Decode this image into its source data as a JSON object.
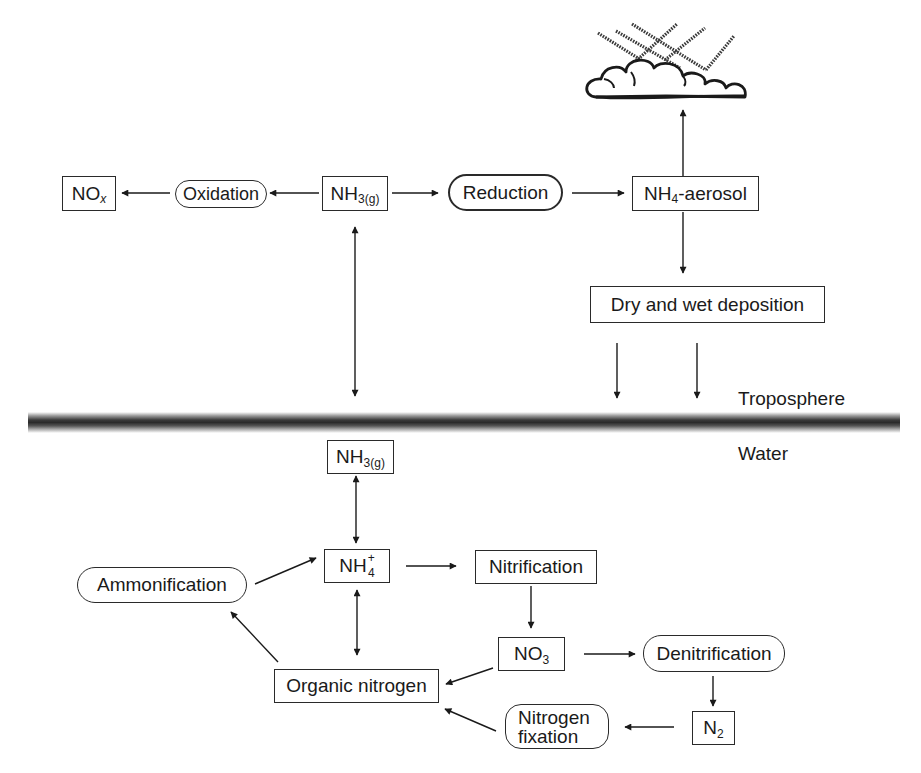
{
  "diagram": {
    "type": "flow",
    "title": "",
    "layers": {
      "upper_label": "Troposphere",
      "lower_label": "Water"
    },
    "nodes": {
      "nox": {
        "main": "NO",
        "sub": "x",
        "shape": "box"
      },
      "oxidation": {
        "label": "Oxidation",
        "shape": "pill"
      },
      "nh3_air": {
        "main": "NH",
        "sub": "3(g)",
        "shape": "box"
      },
      "reduction": {
        "label": "Reduction",
        "shape": "pill-bold"
      },
      "nh4_aerosol": {
        "main": "NH",
        "sub": "4",
        "suffix": "-aerosol",
        "shape": "box"
      },
      "deposition": {
        "label": "Dry and wet deposition",
        "shape": "box"
      },
      "cloud": {
        "icon": "cloud-rain-icon"
      },
      "nh3_water": {
        "main": "NH",
        "sub": "3(g)",
        "shape": "box"
      },
      "nh4_ion": {
        "main": "NH",
        "sub": "4",
        "sup": "+",
        "shape": "box"
      },
      "nitrification": {
        "label": "Nitrification",
        "shape": "box"
      },
      "ammonification": {
        "label": "Ammonification",
        "shape": "pill"
      },
      "no3": {
        "main": "NO",
        "sub": "3",
        "shape": "box"
      },
      "denitrification": {
        "label": "Denitrification",
        "shape": "pill"
      },
      "organic_nitrogen": {
        "label": "Organic nitrogen",
        "shape": "box"
      },
      "nitrogen_fixation": {
        "line1": "Nitrogen",
        "line2": "fixation",
        "shape": "pill"
      },
      "n2": {
        "main": "N",
        "sub": "2",
        "shape": "box"
      }
    },
    "edges": [
      {
        "from": "NH3(g) [air]",
        "to": "Oxidation",
        "direction": "left"
      },
      {
        "from": "Oxidation",
        "to": "NOx",
        "direction": "left"
      },
      {
        "from": "NH3(g) [air]",
        "to": "Reduction",
        "direction": "right"
      },
      {
        "from": "Reduction",
        "to": "NH4-aerosol",
        "direction": "right"
      },
      {
        "from": "NH4-aerosol",
        "to": "Cloud",
        "direction": "up"
      },
      {
        "from": "NH4-aerosol",
        "to": "Dry and wet deposition",
        "direction": "down"
      },
      {
        "from": "Dry and wet deposition",
        "to": "Surface",
        "direction": "down",
        "count": 2
      },
      {
        "from": "NH3(g) [air]",
        "to": "Surface",
        "bidirectional": true
      },
      {
        "from": "NH3(g) [water]",
        "to": "NH4+",
        "bidirectional": true
      },
      {
        "from": "NH4+",
        "to": "Nitrification",
        "direction": "right"
      },
      {
        "from": "Nitrification",
        "to": "NO3",
        "direction": "down"
      },
      {
        "from": "NO3",
        "to": "Denitrification",
        "direction": "right"
      },
      {
        "from": "Denitrification",
        "to": "N2",
        "direction": "down"
      },
      {
        "from": "N2",
        "to": "Nitrogen fixation",
        "direction": "left"
      },
      {
        "from": "Nitrogen fixation",
        "to": "Organic nitrogen",
        "direction": "left"
      },
      {
        "from": "NO3",
        "to": "Organic nitrogen",
        "direction": "left"
      },
      {
        "from": "Organic nitrogen",
        "to": "Ammonification",
        "direction": "up-left"
      },
      {
        "from": "Ammonification",
        "to": "NH4+",
        "direction": "up-right"
      },
      {
        "from": "NH4+",
        "to": "Organic nitrogen",
        "bidirectional": true
      }
    ],
    "colors": {
      "line": "#1a1a1a",
      "background": "#ffffff"
    }
  }
}
